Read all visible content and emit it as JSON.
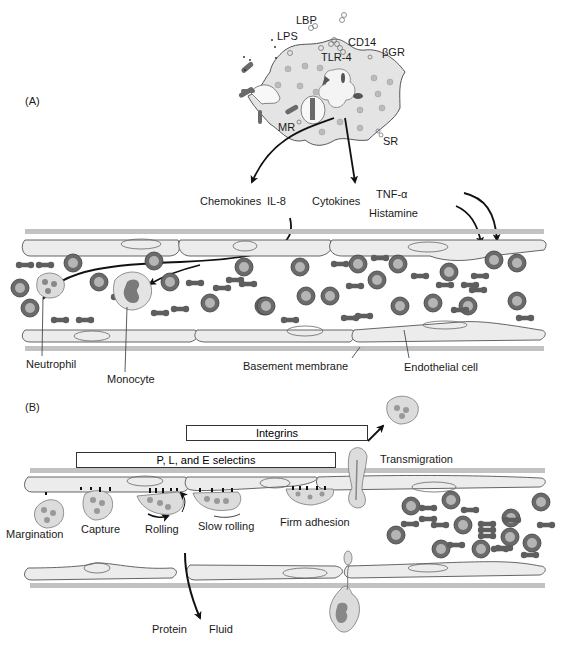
{
  "panel_a": {
    "label": "(A)",
    "macrophage_receptors": [
      "LBP",
      "LPS",
      "CD14",
      "TLR-4",
      "βGR",
      "MR",
      "SR"
    ],
    "mediators": {
      "chemokines": "Chemokines",
      "il8": "IL-8",
      "cytokines": "Cytokines",
      "tnf": "TNF-α",
      "histamine": "Histamine"
    },
    "cell_labels": {
      "neutrophil": "Neutrophil",
      "monocyte": "Monocyte",
      "basement_membrane": "Basement membrane",
      "endothelial_cell": "Endothelial cell"
    }
  },
  "panel_b": {
    "label": "(B)",
    "bars": {
      "integrins": "Integrins",
      "selectins": "P,  L, and E  selectins"
    },
    "steps": [
      "Margination",
      "Capture",
      "Rolling",
      "Slow rolling",
      "Firm adhesion",
      "Transmigration"
    ],
    "outflow": {
      "protein": "Protein",
      "fluid": "Fluid"
    }
  },
  "colors": {
    "cell_fill": "#e4e4e4",
    "membrane": "#bdbdbd",
    "rbc": "#6a6a6a",
    "rbc_center": "#b5b5b5",
    "platelet": "#5e5e5e",
    "outline": "#444444"
  }
}
